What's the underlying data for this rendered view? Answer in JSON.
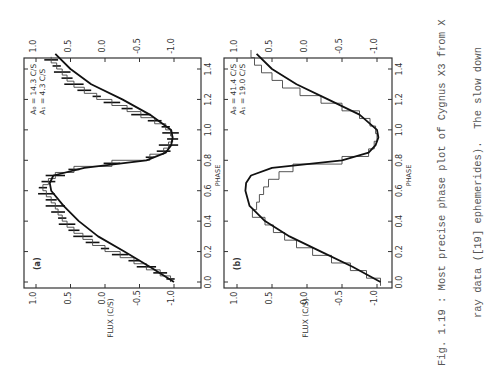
{
  "caption": {
    "line1": "Fig. 1.19 : Most precise phase plot of Cygnus X3 from X",
    "line2": "ray data ([19] ephemerides).  The slow down"
  },
  "chart_data": [
    {
      "type": "line",
      "panel_label": "(a)",
      "xlabel": "PHASE",
      "ylabel": "FLUX (C/S)",
      "xlim": [
        0.0,
        1.55
      ],
      "ylim": [
        -1.15,
        1.05
      ],
      "x_ticks": [
        "0.0",
        "0.2",
        "0.4",
        "0.6",
        "0.8",
        "1.0",
        "1.2",
        "1.4"
      ],
      "y_ticks_left": [
        "1.0",
        "0.5",
        "0.0",
        "-0.5",
        "-1.0"
      ],
      "y_ticks_right": [
        "1.0",
        "0.5",
        "0.0",
        "-0.5",
        "-1.0"
      ],
      "annotation": [
        "A₀ = 14.3 C/S",
        "A₁ = 4.3 C/S"
      ],
      "series": [
        {
          "name": "data (histogram with error bars)",
          "x": [
            0.02,
            0.06,
            0.1,
            0.14,
            0.18,
            0.22,
            0.26,
            0.3,
            0.34,
            0.38,
            0.42,
            0.46,
            0.5,
            0.54,
            0.58,
            0.62,
            0.66,
            0.7,
            0.74,
            0.78,
            0.82,
            0.86,
            0.9,
            0.94,
            0.98,
            1.02,
            1.06,
            1.1,
            1.14,
            1.18,
            1.22,
            1.26,
            1.3,
            1.34,
            1.38,
            1.42,
            1.46
          ],
          "y": [
            -0.95,
            -0.8,
            -0.6,
            -0.42,
            -0.22,
            0.0,
            0.18,
            0.32,
            0.45,
            0.55,
            0.62,
            0.68,
            0.72,
            0.78,
            0.85,
            0.9,
            0.82,
            0.72,
            0.45,
            -0.1,
            -0.65,
            -0.85,
            -0.92,
            -0.98,
            -0.95,
            -0.88,
            -0.72,
            -0.52,
            -0.32,
            -0.1,
            0.12,
            0.3,
            0.45,
            0.55,
            0.62,
            0.7,
            0.78
          ]
        },
        {
          "name": "fit",
          "x": [
            0.0,
            0.1,
            0.2,
            0.3,
            0.4,
            0.5,
            0.6,
            0.65,
            0.7,
            0.75,
            0.8,
            0.85,
            0.9,
            0.95,
            1.0,
            1.1,
            1.2,
            1.3,
            1.4,
            1.5
          ],
          "y": [
            -1.0,
            -0.65,
            -0.28,
            0.1,
            0.38,
            0.6,
            0.78,
            0.8,
            0.75,
            0.3,
            -0.6,
            -0.88,
            -0.96,
            -0.98,
            -0.96,
            -0.65,
            -0.25,
            0.2,
            0.5,
            0.72
          ]
        }
      ]
    },
    {
      "type": "line",
      "panel_label": "(b)",
      "xlabel": "PHASE",
      "ylabel": "FLUX (C/S)",
      "xlim": [
        0.0,
        1.55
      ],
      "ylim": [
        -1.15,
        1.05
      ],
      "x_ticks": [
        "0.0",
        "0.2",
        "0.4",
        "0.6",
        "0.8",
        "1.0",
        "1.2",
        "1.4"
      ],
      "y_ticks_left": [
        "1.0",
        "0.5",
        "0.0",
        "-0.5",
        "-1.0"
      ],
      "y_ticks_right": [
        "1.0",
        "0.5",
        "0.0",
        "-0.5",
        "-1.0"
      ],
      "annotation": [
        "A₀ = 41.4 C/S",
        "A₁ = 19.0 C/S"
      ],
      "series": [
        {
          "name": "data (histogram)",
          "x": [
            0.0,
            0.05,
            0.1,
            0.15,
            0.2,
            0.25,
            0.3,
            0.35,
            0.4,
            0.45,
            0.5,
            0.55,
            0.6,
            0.65,
            0.7,
            0.75,
            0.8,
            0.85,
            0.9,
            0.95,
            1.0,
            1.05,
            1.1,
            1.15,
            1.2,
            1.25,
            1.3,
            1.35,
            1.4,
            1.45,
            1.5
          ],
          "y": [
            -1.05,
            -0.85,
            -0.62,
            -0.35,
            -0.08,
            0.15,
            0.32,
            0.48,
            0.6,
            0.78,
            0.72,
            0.68,
            0.62,
            0.55,
            0.4,
            0.2,
            -0.5,
            -0.88,
            -0.96,
            -1.0,
            -0.98,
            -0.9,
            -0.75,
            -0.5,
            -0.2,
            0.1,
            0.35,
            0.5,
            0.65,
            0.75,
            0.8
          ]
        },
        {
          "name": "fit",
          "x": [
            0.0,
            0.1,
            0.2,
            0.3,
            0.4,
            0.5,
            0.6,
            0.65,
            0.7,
            0.75,
            0.8,
            0.85,
            0.9,
            0.95,
            1.0,
            1.1,
            1.2,
            1.3,
            1.4,
            1.5
          ],
          "y": [
            -1.05,
            -0.65,
            -0.2,
            0.25,
            0.6,
            0.82,
            0.88,
            0.87,
            0.8,
            0.5,
            -0.5,
            -0.88,
            -0.98,
            -1.02,
            -1.0,
            -0.75,
            -0.3,
            0.15,
            0.5,
            0.72
          ]
        }
      ]
    }
  ]
}
